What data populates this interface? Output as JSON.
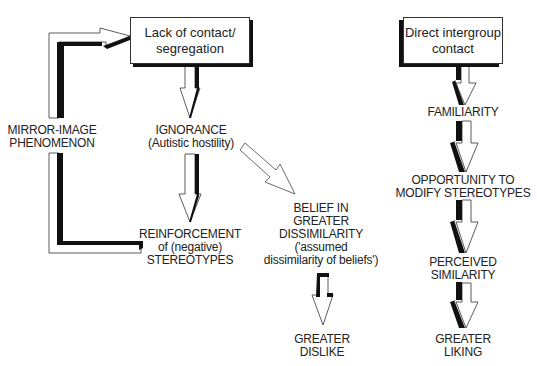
{
  "diagram": {
    "left_flow": {
      "start_box": {
        "line1": "Lack of contact/",
        "line2": "segregation"
      },
      "ignorance": {
        "line1": "IGNORANCE",
        "line2": "(Autistic hostility)"
      },
      "reinforcement": {
        "line1": "REINFORCEMENT",
        "line2": "of (negative)",
        "line3": "STEREOTYPES"
      },
      "mirror_image": {
        "line1": "MIRROR-IMAGE",
        "line2": "PHENOMENON"
      },
      "belief": {
        "line1": "BELIEF IN",
        "line2": "GREATER",
        "line3": "DISSIMILARITY",
        "line4": "('assumed",
        "line5": "dissimilarity of beliefs')"
      },
      "dislike": {
        "line1": "GREATER",
        "line2": "DISLIKE"
      }
    },
    "right_flow": {
      "start_box": {
        "line1": "Direct intergroup",
        "line2": "contact"
      },
      "familiarity": {
        "line1": "FAMILIARITY"
      },
      "opportunity": {
        "line1": "OPPORTUNITY TO",
        "line2": "MODIFY STEREOTYPES"
      },
      "similarity": {
        "line1": "PERCEIVED",
        "line2": "SIMILARITY"
      },
      "liking": {
        "line1": "GREATER",
        "line2": "LIKING"
      }
    },
    "colors": {
      "stroke": "#222222",
      "shadow": "#111111",
      "background": "#ffffff"
    }
  }
}
